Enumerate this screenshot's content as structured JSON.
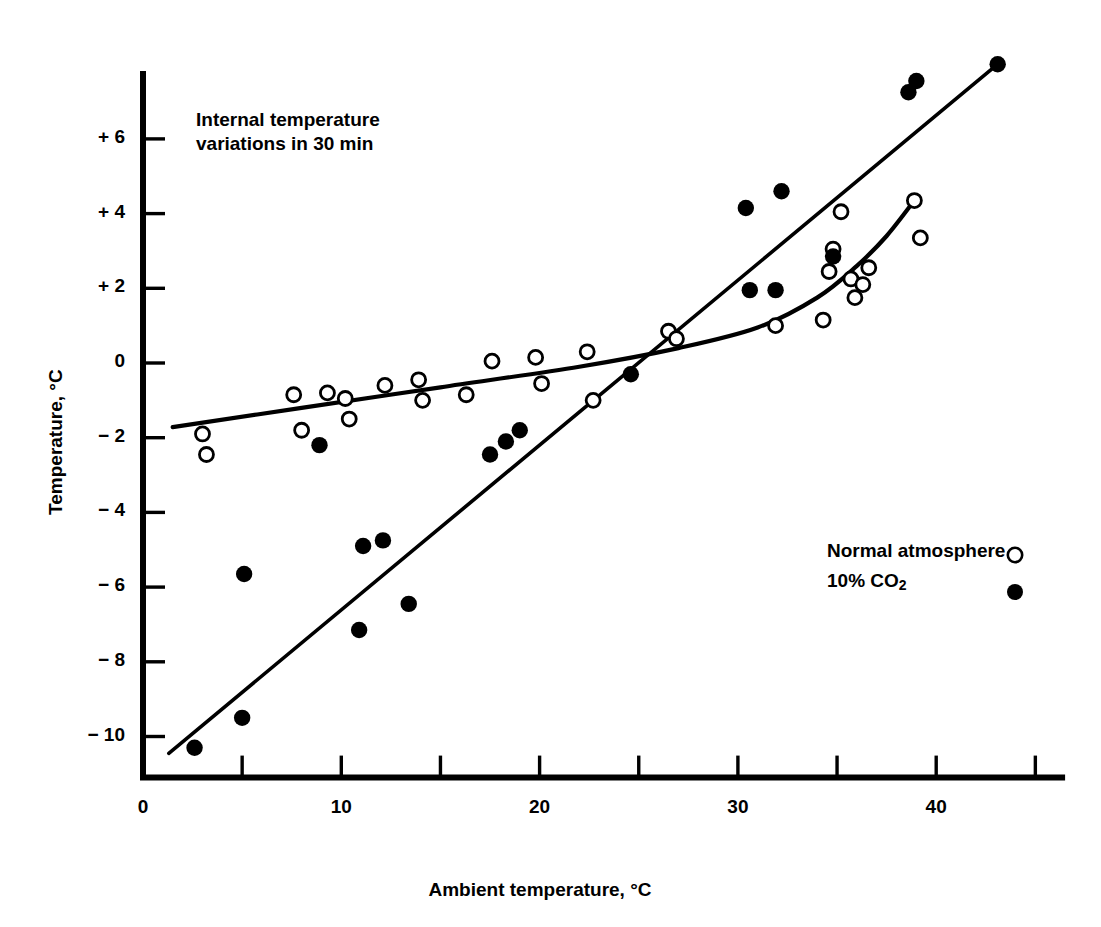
{
  "chart_data": {
    "type": "scatter",
    "title": "",
    "annotation": "Internal temperature\nvariations in 30 min",
    "annotation_line1": "Internal temperature",
    "annotation_line2": "variations in 30 min",
    "xlabel": "Ambient temperature, °C",
    "ylabel": "Temperature, °C",
    "xlim": [
      0,
      46.5
    ],
    "ylim": [
      -11.2,
      8.1
    ],
    "xticks": [
      0,
      10,
      20,
      30,
      40
    ],
    "xtick_labels": [
      "0",
      "10",
      "20",
      "30",
      "40"
    ],
    "xminor_ticks": [
      5,
      15,
      25,
      35,
      45
    ],
    "yticks": [
      6,
      4,
      2,
      0,
      -2,
      -4,
      -6,
      -8,
      -10
    ],
    "ytick_labels": [
      "+ 6",
      "+ 4",
      "+ 2",
      "0",
      "− 2",
      "− 4",
      "− 6",
      "− 8",
      "− 10"
    ],
    "grid": false,
    "legend_position": "lower-right",
    "marker_color": "#000000",
    "line_color": "#000000",
    "background_color": "#ffffff",
    "series": [
      {
        "name": "Normal atmosphere",
        "marker": "open-circle",
        "marker_symbol": "○",
        "points": [
          [
            3.0,
            -1.9
          ],
          [
            3.2,
            -2.45
          ],
          [
            7.6,
            -0.85
          ],
          [
            8.0,
            -1.8
          ],
          [
            9.3,
            -0.8
          ],
          [
            10.2,
            -0.95
          ],
          [
            10.4,
            -1.5
          ],
          [
            12.2,
            -0.6
          ],
          [
            13.9,
            -0.45
          ],
          [
            14.1,
            -1.0
          ],
          [
            16.3,
            -0.85
          ],
          [
            17.6,
            0.05
          ],
          [
            19.8,
            0.15
          ],
          [
            20.1,
            -0.55
          ],
          [
            22.4,
            0.3
          ],
          [
            22.7,
            -1.0
          ],
          [
            26.5,
            0.85
          ],
          [
            26.9,
            0.65
          ],
          [
            31.9,
            1.0
          ],
          [
            34.3,
            1.15
          ],
          [
            34.6,
            2.45
          ],
          [
            34.8,
            3.05
          ],
          [
            35.2,
            4.05
          ],
          [
            35.7,
            2.25
          ],
          [
            35.9,
            1.75
          ],
          [
            36.3,
            2.1
          ],
          [
            36.6,
            2.55
          ],
          [
            38.9,
            4.35
          ],
          [
            39.2,
            3.35
          ]
        ]
      },
      {
        "name": "10% CO2",
        "marker": "filled-circle",
        "marker_symbol": "●",
        "points": [
          [
            2.6,
            -10.3
          ],
          [
            5.0,
            -9.5
          ],
          [
            5.1,
            -5.65
          ],
          [
            8.9,
            -2.2
          ],
          [
            10.9,
            -7.15
          ],
          [
            11.1,
            -4.9
          ],
          [
            12.1,
            -4.75
          ],
          [
            13.4,
            -6.45
          ],
          [
            17.5,
            -2.45
          ],
          [
            18.3,
            -2.1
          ],
          [
            19.0,
            -1.8
          ],
          [
            24.6,
            -0.3
          ],
          [
            30.4,
            4.15
          ],
          [
            30.6,
            1.95
          ],
          [
            31.9,
            1.95
          ],
          [
            32.2,
            4.6
          ],
          [
            34.8,
            2.85
          ],
          [
            38.6,
            7.25
          ],
          [
            39.0,
            7.55
          ],
          [
            43.1,
            8.0
          ]
        ]
      }
    ],
    "fit_lines": [
      {
        "name": "10% CO2 trend",
        "style": "straight",
        "points": [
          [
            1.3,
            -10.45
          ],
          [
            43.1,
            8.0
          ]
        ]
      },
      {
        "name": "Normal atmosphere trend",
        "style": "curve",
        "points": [
          [
            1.5,
            -1.72
          ],
          [
            8.0,
            -1.2
          ],
          [
            15.0,
            -0.65
          ],
          [
            22.0,
            -0.1
          ],
          [
            27.0,
            0.4
          ],
          [
            31.0,
            0.95
          ],
          [
            34.0,
            1.75
          ],
          [
            36.0,
            2.6
          ],
          [
            37.5,
            3.4
          ],
          [
            38.9,
            4.35
          ]
        ]
      }
    ],
    "legend": [
      {
        "label": "Normal atmosphere",
        "marker": "open-circle"
      },
      {
        "label": "10% CO",
        "label_sub": "2",
        "marker": "filled-circle"
      }
    ]
  }
}
